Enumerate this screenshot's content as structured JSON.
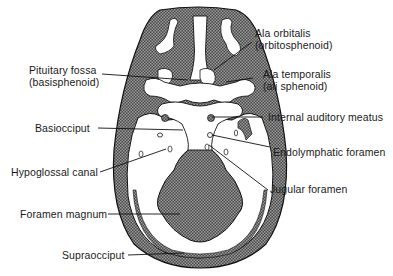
{
  "figure": {
    "type": "anatomical-diagram",
    "colors": {
      "bone_fill": "#3a3a3a",
      "hatch_light": "#8c8c8c",
      "line": "#111111",
      "background": "#ffffff"
    },
    "labels": {
      "pituitary_fossa": {
        "line1": "Pituitary fossa",
        "line2": "(basisphenoid)"
      },
      "basioccipit": {
        "line1": "Basiocciput"
      },
      "hypoglossal_canal": {
        "line1": "Hypoglossal canal"
      },
      "foramen_magnum": {
        "line1": "Foramen magnum"
      },
      "supraoccipit": {
        "line1": "Supraocciput"
      },
      "ala_orbitalis": {
        "line1": "Ala orbitalis",
        "line2": "(orbitosphenoid)"
      },
      "ala_temporalis": {
        "line1": "Ala temporalis",
        "line2": "(ali sphenoid)"
      },
      "internal_auditory_meatus": {
        "line1": "Internal auditory meatus"
      },
      "endolymphatic_foramen": {
        "line1": "Endolymphatic foramen"
      },
      "jugular_foramen": {
        "line1": "Jugular foramen"
      }
    }
  }
}
